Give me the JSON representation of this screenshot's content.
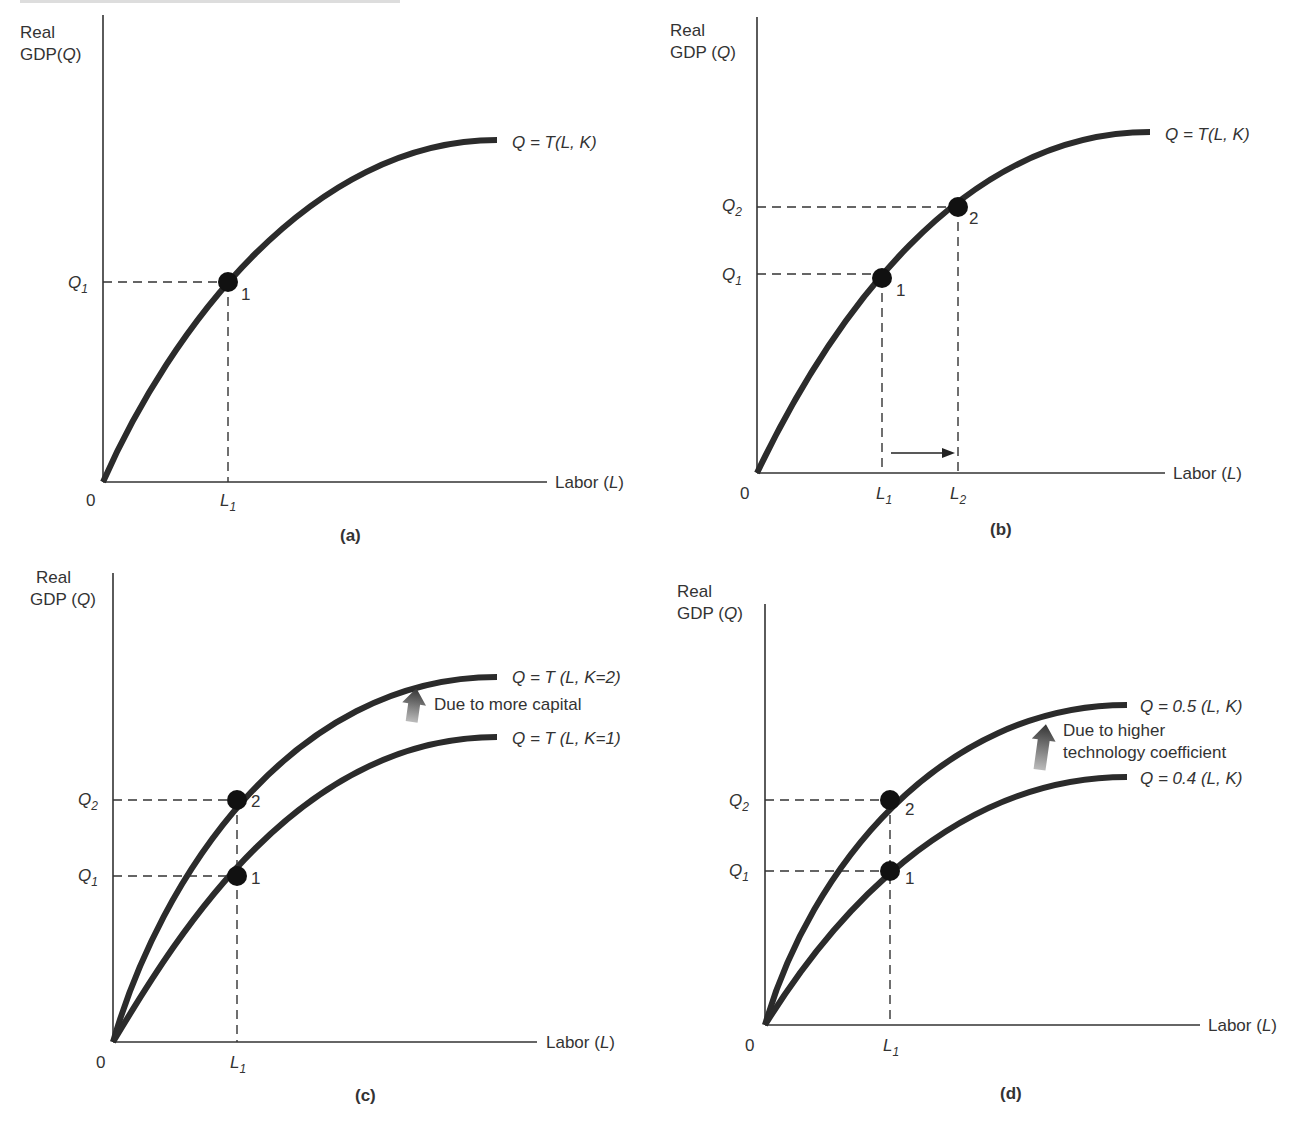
{
  "header": {
    "cropped_text_line": ""
  },
  "colors": {
    "curve": "#2b2b2b",
    "axis": "#333333",
    "text": "#333333",
    "point": "#111111",
    "arrow_gradient_top": "#333333",
    "arrow_gradient_bottom": "#bbbbbb"
  },
  "panels": {
    "a": {
      "caption": "(a)",
      "y_label_line1": "Real",
      "y_label_line2": "GDP(Q)",
      "x_label": "Labor (L)",
      "origin": "0",
      "curve_label": "Q = T(L, K)",
      "q1": "Q",
      "q1_sub": "1",
      "l1": "L",
      "l1_sub": "1",
      "point1": "1"
    },
    "b": {
      "caption": "(b)",
      "y_label_line1": "Real",
      "y_label_line2": "GDP (Q)",
      "x_label": "Labor (L)",
      "origin": "0",
      "curve_label": "Q = T(L, K)",
      "q1": "Q",
      "q1_sub": "1",
      "q2": "Q",
      "q2_sub": "2",
      "l1": "L",
      "l1_sub": "1",
      "l2": "L",
      "l2_sub": "2",
      "point1": "1",
      "point2": "2"
    },
    "c": {
      "caption": "(c)",
      "y_label_line1": "Real",
      "y_label_line2": "GDP (Q)",
      "x_label": "Labor (L)",
      "origin": "0",
      "curve_upper_label": "Q = T (L, K=2)",
      "curve_lower_label": "Q = T (L, K=1)",
      "shift_note": "Due to more capital",
      "q1": "Q",
      "q1_sub": "1",
      "q2": "Q",
      "q2_sub": "2",
      "l1": "L",
      "l1_sub": "1",
      "point1": "1",
      "point2": "2"
    },
    "d": {
      "caption": "(d)",
      "y_label_line1": "Real",
      "y_label_line2": "GDP (Q)",
      "x_label": "Labor (L)",
      "origin": "0",
      "curve_upper_label": "Q = 0.5 (L, K)",
      "curve_lower_label": "Q = 0.4 (L, K)",
      "shift_note_line1": "Due to higher",
      "shift_note_line2": "technology coefficient",
      "q1": "Q",
      "q1_sub": "1",
      "q2": "Q",
      "q2_sub": "2",
      "l1": "L",
      "l1_sub": "1",
      "point1": "1",
      "point2": "2"
    }
  }
}
